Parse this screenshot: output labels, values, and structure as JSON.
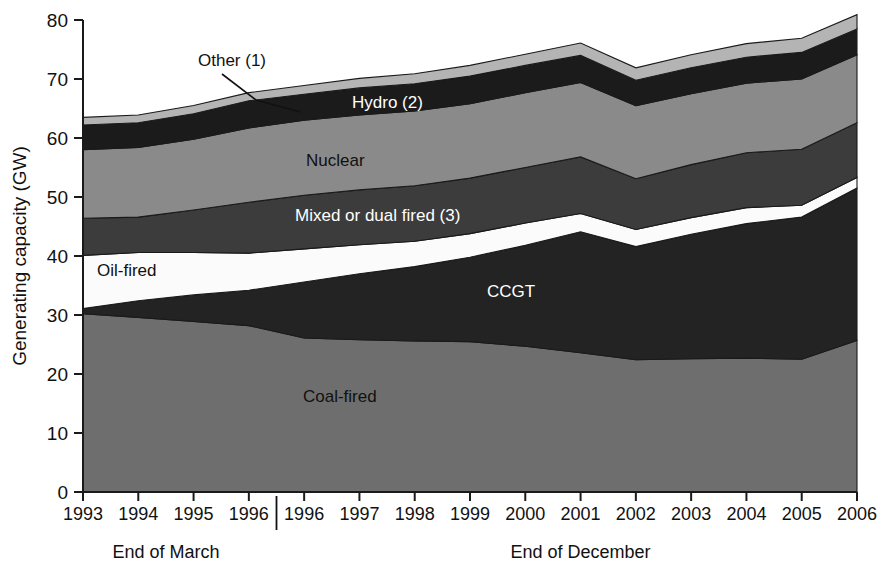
{
  "chart_data": {
    "type": "area",
    "stacked": true,
    "title": "",
    "xlabel": "",
    "ylabel": "Generating capacity (GW)",
    "ylim": [
      0,
      80
    ],
    "ytick_step": 10,
    "yticks": [
      0,
      10,
      20,
      30,
      40,
      50,
      60,
      70,
      80
    ],
    "grid": false,
    "legend_position": "inline-labels",
    "x": [
      1993,
      1994,
      1995,
      1996,
      1996,
      1997,
      1998,
      1999,
      2000,
      2001,
      2002,
      2003,
      2004,
      2005,
      2006
    ],
    "xtick_labels": [
      "1993",
      "1994",
      "1995",
      "1996",
      "1996",
      "1997",
      "1998",
      "1999",
      "2000",
      "2001",
      "2002",
      "2003",
      "2004",
      "2005",
      "2006"
    ],
    "x_group_labels": [
      {
        "label": "End of March",
        "spans": [
          "1993",
          "1994",
          "1995",
          "1996"
        ]
      },
      {
        "label": "End of December",
        "spans": [
          "1996",
          "1997",
          "1998",
          "1999",
          "2000",
          "2001",
          "2002",
          "2003",
          "2004",
          "2005",
          "2006"
        ]
      }
    ],
    "x_group_divider_after_index": 3,
    "stack_order_bottom_to_top": [
      "Coal-fired",
      "CCGT",
      "Oil-fired",
      "Mixed or dual fired (3)",
      "Nuclear",
      "Hydro (2)",
      "Other (1)"
    ],
    "series": [
      {
        "name": "Coal-fired",
        "label": "Coal-fired",
        "color": "#6e6e6e",
        "label_color": "#111111",
        "values": [
          30.2,
          29.6,
          28.9,
          28.2,
          26.1,
          25.8,
          25.6,
          25.5,
          24.7,
          23.6,
          22.4,
          22.6,
          22.7,
          22.5,
          25.7
        ]
      },
      {
        "name": "CCGT",
        "label": "CCGT",
        "color": "#232323",
        "label_color": "#ffffff",
        "values": [
          0.9,
          2.8,
          4.5,
          6.0,
          9.5,
          11.2,
          12.6,
          14.3,
          17.1,
          20.5,
          19.2,
          21.1,
          22.8,
          24.1,
          25.8
        ]
      },
      {
        "name": "Oil-fired",
        "label": "Oil-fired",
        "color": "#fbfbfb",
        "label_color": "#111111",
        "values": [
          9.0,
          8.2,
          7.2,
          6.3,
          5.6,
          4.9,
          4.3,
          4.0,
          3.8,
          3.1,
          2.9,
          2.8,
          2.7,
          2.0,
          1.8
        ]
      },
      {
        "name": "Mixed or dual fired (3)",
        "label": "Mixed or dual fired (3)",
        "color": "#3c3c3c",
        "label_color": "#ffffff",
        "values": [
          6.3,
          6.0,
          7.2,
          8.6,
          9.1,
          9.3,
          9.4,
          9.4,
          9.4,
          9.6,
          8.6,
          9.0,
          9.3,
          9.5,
          9.3
        ]
      },
      {
        "name": "Nuclear",
        "label": "Nuclear",
        "color": "#8a8a8a",
        "label_color": "#111111",
        "values": [
          11.6,
          11.8,
          12.0,
          12.6,
          12.7,
          12.7,
          12.7,
          12.6,
          12.7,
          12.6,
          12.4,
          12.0,
          11.8,
          11.9,
          11.5
        ]
      },
      {
        "name": "Hydro (2)",
        "label": "Hydro (2)",
        "color": "#1b1b1b",
        "label_color": "#ffffff",
        "values": [
          4.2,
          4.2,
          4.3,
          4.6,
          4.4,
          4.6,
          4.6,
          4.7,
          4.6,
          4.6,
          4.3,
          4.4,
          4.4,
          4.5,
          4.4
        ]
      },
      {
        "name": "Other (1)",
        "label": "Other (1)",
        "color": "#b4b4b4",
        "label_color": "#111111",
        "values": [
          1.3,
          1.3,
          1.4,
          1.4,
          1.5,
          1.6,
          1.7,
          1.8,
          1.9,
          2.1,
          2.1,
          2.2,
          2.3,
          2.4,
          2.4
        ]
      }
    ],
    "stack_totals": [
      63.5,
      63.9,
      65.5,
      67.7,
      68.9,
      70.1,
      70.9,
      72.3,
      74.2,
      76.1,
      71.9,
      74.1,
      76.0,
      76.9,
      80.9
    ],
    "annotations": [
      {
        "text": "Other (1)",
        "kind": "callout-with-leader",
        "target_series": "Other (1)"
      },
      {
        "text": "Hydro (2)",
        "kind": "inline",
        "target_series": "Hydro (2)"
      },
      {
        "text": "Nuclear",
        "kind": "inline",
        "target_series": "Nuclear"
      },
      {
        "text": "Mixed or dual fired (3)",
        "kind": "inline",
        "target_series": "Mixed or dual fired (3)"
      },
      {
        "text": "Oil-fired",
        "kind": "inline",
        "target_series": "Oil-fired"
      },
      {
        "text": "CCGT",
        "kind": "inline",
        "target_series": "CCGT"
      },
      {
        "text": "Coal-fired",
        "kind": "inline",
        "target_series": "Coal-fired"
      }
    ]
  },
  "yaxis": {
    "title": "Generating capacity (GW)",
    "labels": [
      "80",
      "70",
      "60",
      "50",
      "40",
      "30",
      "20",
      "10",
      "0"
    ]
  },
  "xaxis": {
    "labels": [
      "1993",
      "1994",
      "1995",
      "1996",
      "1996",
      "1997",
      "1998",
      "1999",
      "2000",
      "2001",
      "2002",
      "2003",
      "2004",
      "2005",
      "2006"
    ],
    "group_left": "End of March",
    "group_right": "End of December"
  },
  "series_labels": {
    "other": "Other (1)",
    "hydro": "Hydro (2)",
    "nuclear": "Nuclear",
    "mixed": "Mixed or dual fired (3)",
    "oil": "Oil-fired",
    "ccgt": "CCGT",
    "coal": "Coal-fired"
  },
  "colors": {
    "coal": "#6e6e6e",
    "ccgt": "#232323",
    "oil": "#fbfbfb",
    "mixed": "#3c3c3c",
    "nuclear": "#8a8a8a",
    "hydro": "#1b1b1b",
    "other": "#b4b4b4",
    "axis": "#1a1a1a",
    "text": "#111111",
    "background": "#ffffff"
  }
}
